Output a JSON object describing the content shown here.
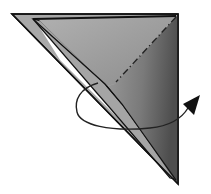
{
  "diagram": {
    "type": "origami-fold-step",
    "colors": {
      "background": "#ffffff",
      "paper_light": "#a9a9a9",
      "paper_mid": "#8f8f8f",
      "paper_dark": "#5e5e5e",
      "edge": "#111111",
      "gap": "#ffffff",
      "arrow": "#222222"
    },
    "elements": {
      "fold_line": "mountain-fold-dash-dot",
      "arrow": "curved-rotation-arrow"
    }
  }
}
